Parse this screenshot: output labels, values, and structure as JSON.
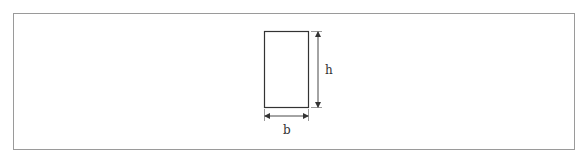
{
  "diagram": {
    "shape": "rectangle",
    "labels": {
      "height": "h",
      "width": "b"
    },
    "colors": {
      "stroke": "#333333",
      "frame": "#9a9a9a",
      "background": "#ffffff"
    }
  }
}
